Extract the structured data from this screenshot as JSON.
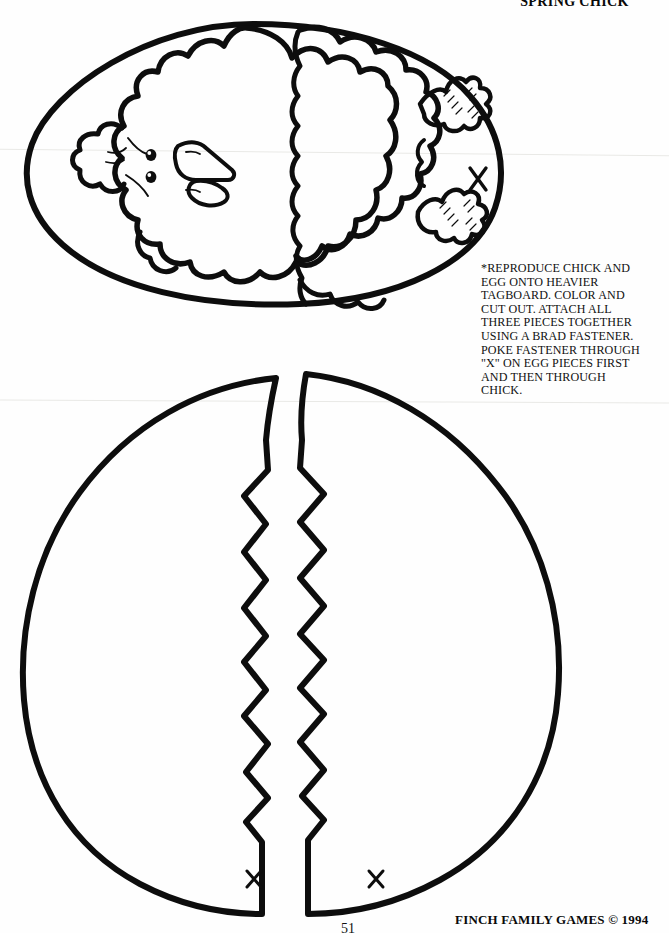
{
  "document": {
    "title": "\"SPRING CHICK\"",
    "instructions": "*REPRODUCE CHICK AND\nEGG ONTO HEAVIER\nTAGBOARD.  COLOR AND\nCUT OUT.  ATTACH ALL\nTHREE PIECES TOGETHER\nUSING A BRAD FASTENER.\nPOKE FASTENER THROUGH\n\"X\" ON EGG PIECES FIRST\nAND THEN THROUGH\nCHICK.",
    "footer": "FINCH FAMILY GAMES  © 1994",
    "page_number": "51"
  },
  "marks": {
    "chick_x": "×",
    "egg_left_x": "×",
    "egg_right_x": "×"
  },
  "colors": {
    "ink": "#0d0d0d",
    "paper": "#ffffff"
  }
}
